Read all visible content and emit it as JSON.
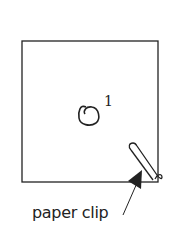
{
  "diagram": {
    "type": "origami-step",
    "step_number": "1",
    "annotation_label": "paper clip",
    "elements": {
      "paper_square": "square sheet outline",
      "fold_symbol": "rotation/curl symbol",
      "paper_clip": "paper clip attached at bottom-right corner",
      "arrow": "leader arrow pointing to clip"
    },
    "colors": {
      "stroke": "#222222",
      "background": "#ffffff"
    }
  }
}
